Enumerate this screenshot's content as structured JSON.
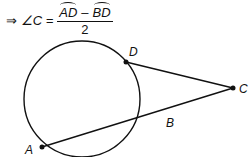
{
  "formula": {
    "implies": "⇒",
    "angle": "∠C =",
    "arc1": "AD",
    "minus": "–",
    "arc2": "BD",
    "denominator": "2"
  },
  "diagram": {
    "points": {
      "A": {
        "label": "A",
        "x": 42,
        "y": 147
      },
      "B": {
        "label": "B",
        "x": 170,
        "y": 123
      },
      "C": {
        "label": "C",
        "x": 233,
        "y": 88
      },
      "D": {
        "label": "D",
        "x": 126,
        "y": 62
      }
    },
    "circle": {
      "cx": 82,
      "cy": 99,
      "r": 58
    },
    "stroke_color": "#111111"
  }
}
